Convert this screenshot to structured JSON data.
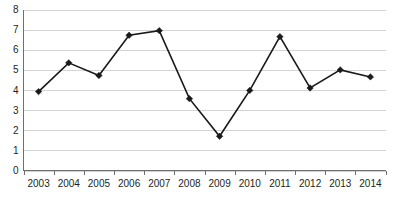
{
  "chart_data": {
    "type": "line",
    "title": "",
    "subtitle": "",
    "xlabel": "",
    "ylabel": "",
    "categories": [
      "2003",
      "2004",
      "2005",
      "2006",
      "2007",
      "2008",
      "2009",
      "2010",
      "2011",
      "2012",
      "2013",
      "2014"
    ],
    "values": [
      3.92,
      5.35,
      4.72,
      6.72,
      6.95,
      3.57,
      1.7,
      3.98,
      6.65,
      4.1,
      5.0,
      4.65
    ],
    "series": [
      {
        "name": "",
        "values": [
          3.92,
          5.35,
          4.72,
          6.72,
          6.95,
          3.57,
          1.7,
          3.98,
          6.65,
          4.1,
          5.0,
          4.65
        ]
      }
    ],
    "ylim": [
      0,
      8
    ],
    "yticks": [
      "0",
      "1",
      "2",
      "3",
      "4",
      "5",
      "6",
      "7",
      "8"
    ],
    "ytick_values": [
      0,
      1,
      2,
      3,
      4,
      5,
      6,
      7,
      8
    ],
    "xticks": [
      "2003",
      "2004",
      "2005",
      "2006",
      "2007",
      "2008",
      "2009",
      "2010",
      "2011",
      "2012",
      "2013",
      "2014"
    ],
    "grid": true,
    "grid_axis": "y",
    "legend": false,
    "legend_position": "none",
    "marker": "diamond",
    "annotations": [],
    "colors": {
      "line": "#1a1a1a",
      "marker": "#1a1a1a",
      "grid": "#d4d4d4",
      "axis": "#6f6f6f",
      "background": "#ffffff",
      "text": "#231f20"
    }
  }
}
